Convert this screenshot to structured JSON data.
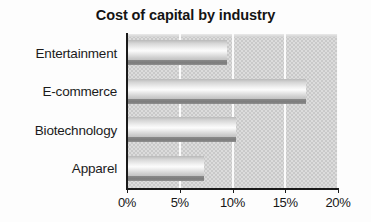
{
  "chart_data": {
    "type": "bar",
    "orientation": "horizontal",
    "title": "Cost of capital by industry",
    "xlabel": "",
    "ylabel": "",
    "categories": [
      "Entertainment",
      "E-commerce",
      "Biotechnology",
      "Apparel"
    ],
    "values": [
      9.5,
      17.0,
      10.3,
      7.3
    ],
    "value_unit": "%",
    "xlim": [
      0,
      20
    ],
    "xticks": [
      0,
      5,
      10,
      15,
      20
    ],
    "xtick_labels": [
      "0%",
      "5%",
      "10%",
      "15%",
      "20%"
    ],
    "grid": true,
    "grid_axis": "x",
    "legend": false,
    "series": [
      {
        "name": "Cost of capital",
        "values": [
          9.5,
          17.0,
          10.3,
          7.3
        ]
      }
    ],
    "colors": {
      "plot_background": "#c9c9c9",
      "bar_fill_light": "#fcfcfc",
      "bar_fill_dark": "#b9b9b9",
      "bar_shadow": "#828282",
      "gridline": "#fbfbfb",
      "axis": "#1a1a1a",
      "text": "#171717",
      "page_background": "#ffffff"
    }
  }
}
